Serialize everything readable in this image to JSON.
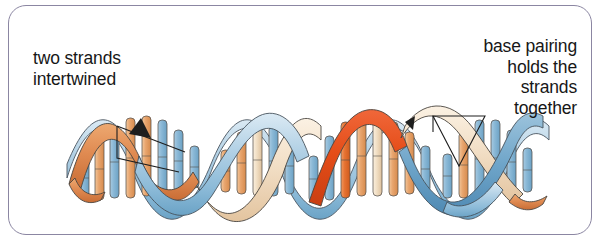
{
  "figure": {
    "panel_border_color": "#8b86a2",
    "background_color": "#ffffff",
    "text_color": "#171717"
  },
  "annotations": {
    "left": {
      "text": "two strands\nintertwined",
      "lines": [
        "two strands",
        "intertwined"
      ],
      "align": "left"
    },
    "right": {
      "text": "base pairing\nholds the\nstrands\ntogether",
      "lines": [
        "base pairing",
        "holds the",
        "strands",
        "together"
      ],
      "align": "right"
    }
  },
  "diagram": {
    "name": "dna-double-helix",
    "strand_colors": {
      "blue_light": "#b9d4e6",
      "blue_mid": "#8fbcd8",
      "blue_dark": "#5b94bd",
      "cream": "#f4e0c8",
      "tan": "#e8c6a0",
      "orange": "#e08b52",
      "orange_deep": "#d95f2a",
      "orange_red": "#e14b18",
      "outline": "#3a3a3a"
    },
    "helix": {
      "periods": 2,
      "amplitude_px": 52,
      "midline_y_px": 158,
      "start_x_px": 58,
      "end_x_px": 540,
      "ribbon_width_px": 13,
      "phase_offset_deg": 180
    },
    "rungs": {
      "count": 28,
      "orientation": "vertical",
      "pair_colors": [
        "#8fbcd8",
        "#e8a56e"
      ]
    },
    "pointers": [
      {
        "name": "left-pointer",
        "shape": "bracket-with-leader",
        "from_x_px": 118,
        "from_y_px": 130,
        "to_x_px": 196,
        "to_y_px": 158
      },
      {
        "name": "right-pointer",
        "shape": "bracket-with-leader",
        "from_x_px": 428,
        "from_y_px": 118,
        "to_x_px": 492,
        "to_y_px": 128
      }
    ]
  }
}
